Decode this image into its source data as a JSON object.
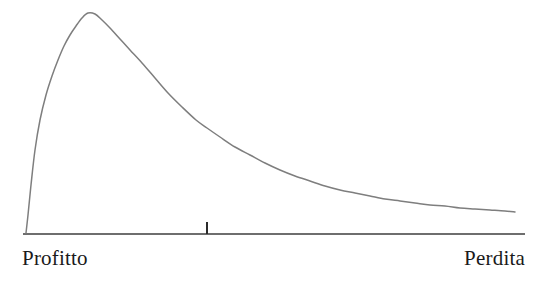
{
  "figure": {
    "name": "profit-loss-distribution-curve",
    "background_color": "#ffffff",
    "width": 537,
    "height": 282
  },
  "axis": {
    "line_color": "#6e6e6e",
    "left_label": "Profitto",
    "right_label": "Perdita",
    "tick_color": "#2b2b2b"
  },
  "curve": {
    "color": "#7e7e7e",
    "stroke_width": 1.5
  },
  "chart_data": {
    "type": "line",
    "title": "",
    "subtitle": "",
    "xlabel": "",
    "ylabel": "",
    "grid": false,
    "legend": null,
    "axis_tick_labels": [
      "Profitto",
      "Perdita"
    ],
    "annotations": [
      {
        "name": "axis-tick-mark",
        "x_px": 207,
        "y_top_px": 222,
        "y_bottom_px": 234,
        "label": ""
      }
    ],
    "axis_line": {
      "x_start_px": 23,
      "x_end_px": 525,
      "y_px": 234
    },
    "xlim": [
      23,
      525
    ],
    "ylim": [
      234,
      13
    ],
    "x": [
      26,
      28,
      31,
      35,
      40,
      46,
      52,
      58,
      64,
      70,
      76,
      82,
      88,
      95,
      102,
      110,
      120,
      130,
      142,
      155,
      168,
      182,
      196,
      207,
      220,
      235,
      250,
      265,
      280,
      295,
      310,
      325,
      340,
      355,
      370,
      385,
      400,
      415,
      430,
      445,
      460,
      475,
      490,
      505,
      515
    ],
    "y": [
      233,
      215,
      185,
      150,
      120,
      95,
      76,
      60,
      46,
      35,
      26,
      18,
      13,
      14,
      20,
      28,
      39,
      50,
      63,
      78,
      93,
      107,
      120,
      128,
      137,
      147,
      155,
      163,
      170,
      176,
      181,
      186,
      190,
      193,
      196,
      199,
      201,
      203,
      205,
      206,
      208,
      209,
      210,
      211,
      212
    ],
    "peak": {
      "x_px": 88,
      "y_px": 13
    },
    "start": {
      "x_px": 26,
      "y_px": 233
    },
    "end": {
      "x_px": 515,
      "y_px": 212
    }
  }
}
